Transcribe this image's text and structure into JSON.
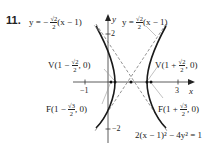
{
  "problem_number": "11.",
  "asymptote_left": {
    "prefix": "y = −",
    "num": "√2",
    "den": "2",
    "suffix": "(x − 1)"
  },
  "asymptote_right": {
    "prefix": "y =",
    "num": "√2",
    "den": "2",
    "suffix": "(x − 1)"
  },
  "vertex_left": {
    "prefix": "V(1 −",
    "num": "√2",
    "den": "2",
    "suffix": ", 0)"
  },
  "vertex_right": {
    "prefix": "V(1 +",
    "num": "√2",
    "den": "2",
    "suffix": ", 0)"
  },
  "focus_left": {
    "prefix": "F(1 −",
    "num": "√3",
    "den": "2",
    "suffix": ", 0)"
  },
  "focus_right": {
    "prefix": "F(1 +",
    "num": "√3",
    "den": "2",
    "suffix": ", 0)"
  },
  "equation": "2(x − 1)² − 4y² = 1",
  "axes": {
    "x_label": "x",
    "y_label": "y",
    "x_ticks": [
      "−1",
      "3"
    ],
    "y_ticks": [
      "2",
      "−2"
    ]
  },
  "colors": {
    "curve": "#1a1a1a",
    "asymptote": "#777777",
    "axis": "#333333",
    "leader": "#999999"
  }
}
